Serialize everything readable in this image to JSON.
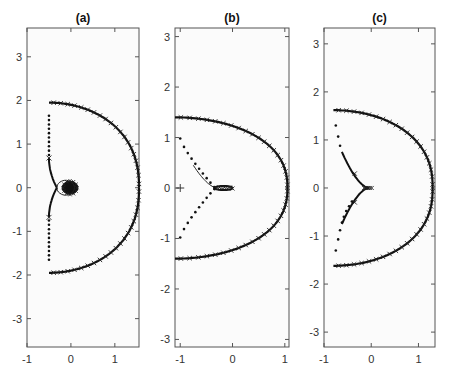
{
  "chart_data": [
    {
      "type": "scatter",
      "title": "(a)",
      "xlabel": "",
      "ylabel": "",
      "xlim": [
        -1,
        1.55
      ],
      "ylim": [
        -3.65,
        3.66
      ],
      "xticks": [
        -1,
        0,
        1
      ],
      "yticks": [
        -3,
        -2,
        -1,
        0,
        1,
        2,
        3
      ],
      "grid": false,
      "arc": {
        "radius": 1.95,
        "x_start": -0.5,
        "right_extent": 1.55
      },
      "dotted_branch": {
        "x": -0.5,
        "y_from": 1.65,
        "y_to": 0.68
      },
      "inner_branch": {
        "from": [
          -0.5,
          0.68
        ],
        "loop_center": [
          0.0,
          0.0
        ],
        "loop_radius": 0.2
      }
    },
    {
      "type": "scatter",
      "title": "(b)",
      "xlabel": "",
      "ylabel": "",
      "xlim": [
        -1.1,
        1.08
      ],
      "ylim": [
        -3.15,
        3.17
      ],
      "xticks": [
        -1,
        0,
        1
      ],
      "yticks": [
        -3,
        -2,
        -1,
        0,
        1,
        2,
        3
      ],
      "grid": false,
      "arc": {
        "radius": 1.4,
        "x_start": -1.1,
        "right_extent": 1.05
      },
      "dotted_branch": {
        "from": [
          -1.0,
          0.98
        ],
        "to": [
          -0.35,
          0.02
        ]
      },
      "inner_branch": {
        "from": [
          -0.75,
          0.45
        ],
        "to": [
          -0.05,
          0.0
        ]
      },
      "marker_plus": [
        -1.0,
        0.0
      ]
    },
    {
      "type": "scatter",
      "title": "(c)",
      "xlabel": "",
      "ylabel": "",
      "xlim": [
        -1,
        1.35
      ],
      "ylim": [
        -3.31,
        3.33
      ],
      "xticks": [
        -1,
        0,
        1
      ],
      "yticks": [
        -3,
        -2,
        -1,
        0,
        1,
        2,
        3
      ],
      "grid": false,
      "arc": {
        "radius": 1.62,
        "x_start": -0.8,
        "right_extent": 1.3
      },
      "dotted_branch": {
        "from": [
          -0.75,
          1.3
        ],
        "to": [
          -0.6,
          0.75
        ]
      },
      "inner_branch": {
        "from": [
          -0.6,
          0.75
        ],
        "to": [
          -0.05,
          0.0
        ]
      }
    }
  ],
  "panels": [
    {
      "title": "(a)",
      "box": [
        27,
        28,
        139,
        347
      ],
      "xlim": [
        -1,
        1.55
      ],
      "ylim": [
        -3.65,
        3.66
      ],
      "xticks": [
        -1,
        0,
        1
      ],
      "yticks": [
        -3,
        -2,
        -1,
        0,
        1,
        2,
        3
      ]
    },
    {
      "title": "(b)",
      "box": [
        175,
        28,
        289,
        347
      ],
      "xlim": [
        -1.1,
        1.08
      ],
      "ylim": [
        -3.15,
        3.17
      ],
      "xticks": [
        -1,
        0,
        1
      ],
      "yticks": [
        -3,
        -2,
        -1,
        0,
        1,
        2,
        3
      ]
    },
    {
      "title": "(c)",
      "box": [
        324,
        28,
        435,
        347
      ],
      "xlim": [
        -1,
        1.35
      ],
      "ylim": [
        -3.31,
        3.33
      ],
      "xticks": [
        -1,
        0,
        1
      ],
      "yticks": [
        -3,
        -2,
        -1,
        0,
        1,
        2,
        3
      ]
    }
  ],
  "tick_labels": {
    "x": [
      "-1",
      "0",
      "1"
    ],
    "y": [
      "-3",
      "-2",
      "-1",
      "0",
      "1",
      "2",
      "3"
    ]
  }
}
